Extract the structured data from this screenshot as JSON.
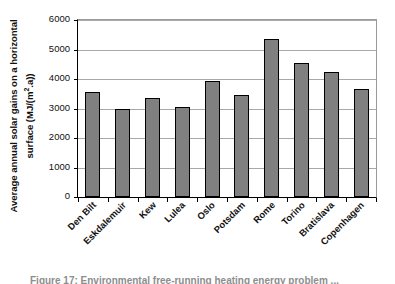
{
  "chart_data": {
    "type": "bar",
    "title": "",
    "xlabel": "",
    "ylabel": "Average annual solar gains on a horizontal surface (MJ/(m².a))",
    "ylabel_line1": "Average annual solar gains on a horizontal",
    "ylabel_line2_pre": "surface (MJ/(m",
    "ylabel_line2_sup": "2",
    "ylabel_line2_post": ".a))",
    "categories": [
      "Den Bilt",
      "Eskdalemuir",
      "Kew",
      "Lulea",
      "Oslo",
      "Potsdam",
      "Rome",
      "Torino",
      "Bratislava",
      "Copenhagen"
    ],
    "values": [
      3550,
      3000,
      3370,
      3060,
      3930,
      3450,
      5350,
      4540,
      4230,
      3650
    ],
    "ylim": [
      0,
      6000
    ],
    "ytick_labels": [
      "6000",
      "5000",
      "4000",
      "3000",
      "2000",
      "1000",
      "0"
    ],
    "ytick_values": [
      6000,
      5000,
      4000,
      3000,
      2000,
      1000,
      0
    ],
    "grid": true,
    "legend": "none",
    "bar_color": "#808080",
    "bar_edge_color": "#000000",
    "gridline_color": "#a8a8a8",
    "axis_color": "#000000",
    "background": "#ffffff"
  },
  "caption": {
    "text": "Figure 17: Environmental free-running heating energy problem ..."
  }
}
